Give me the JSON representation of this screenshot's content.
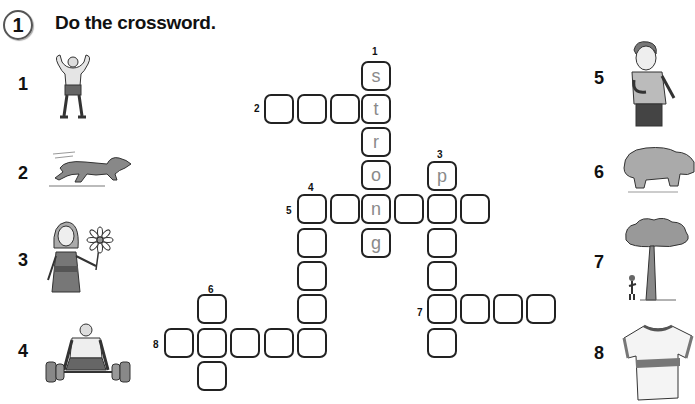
{
  "exercise": {
    "number": "1",
    "instruction": "Do the crossword."
  },
  "pictures": [
    {
      "number": "1",
      "subject": "strong man flexing muscles"
    },
    {
      "number": "2",
      "subject": "dog running"
    },
    {
      "number": "3",
      "subject": "girl holding a flower"
    },
    {
      "number": "4",
      "subject": "man lifting heavy weights"
    },
    {
      "number": "5",
      "subject": "boy standing"
    },
    {
      "number": "6",
      "subject": "hippo"
    },
    {
      "number": "7",
      "subject": "tall tree next to a small person"
    },
    {
      "number": "8",
      "subject": "t-shirt"
    }
  ],
  "clue_labels": {
    "c1": "1",
    "c2": "2",
    "c3": "3",
    "c4": "4",
    "c5": "5",
    "c6": "6",
    "c7": "7",
    "c8": "8"
  },
  "grid": {
    "cells": [
      {
        "x": 361,
        "y": 61,
        "letter": "s"
      },
      {
        "x": 361,
        "y": 94,
        "letter": "t"
      },
      {
        "x": 361,
        "y": 127,
        "letter": "r"
      },
      {
        "x": 361,
        "y": 160,
        "letter": "o"
      },
      {
        "x": 361,
        "y": 194,
        "letter": "n"
      },
      {
        "x": 361,
        "y": 228,
        "letter": "g"
      },
      {
        "x": 264,
        "y": 94,
        "letter": ""
      },
      {
        "x": 297,
        "y": 94,
        "letter": ""
      },
      {
        "x": 330,
        "y": 94,
        "letter": ""
      },
      {
        "x": 427,
        "y": 161,
        "letter": "p"
      },
      {
        "x": 427,
        "y": 194,
        "letter": ""
      },
      {
        "x": 427,
        "y": 228,
        "letter": ""
      },
      {
        "x": 427,
        "y": 261,
        "letter": ""
      },
      {
        "x": 427,
        "y": 294,
        "letter": ""
      },
      {
        "x": 427,
        "y": 328,
        "letter": ""
      },
      {
        "x": 297,
        "y": 194,
        "letter": ""
      },
      {
        "x": 330,
        "y": 194,
        "letter": ""
      },
      {
        "x": 394,
        "y": 194,
        "letter": ""
      },
      {
        "x": 460,
        "y": 194,
        "letter": ""
      },
      {
        "x": 297,
        "y": 228,
        "letter": ""
      },
      {
        "x": 297,
        "y": 261,
        "letter": ""
      },
      {
        "x": 297,
        "y": 294,
        "letter": ""
      },
      {
        "x": 297,
        "y": 328,
        "letter": ""
      },
      {
        "x": 164,
        "y": 328,
        "letter": ""
      },
      {
        "x": 197,
        "y": 328,
        "letter": ""
      },
      {
        "x": 230,
        "y": 328,
        "letter": ""
      },
      {
        "x": 264,
        "y": 328,
        "letter": ""
      },
      {
        "x": 197,
        "y": 294,
        "letter": ""
      },
      {
        "x": 197,
        "y": 361,
        "letter": ""
      },
      {
        "x": 460,
        "y": 294,
        "letter": ""
      },
      {
        "x": 493,
        "y": 294,
        "letter": ""
      },
      {
        "x": 526,
        "y": 294,
        "letter": ""
      }
    ]
  }
}
